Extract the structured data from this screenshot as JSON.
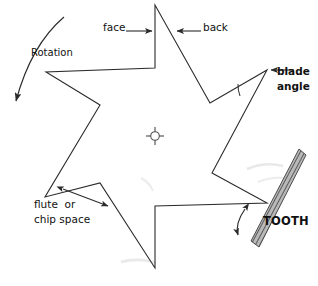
{
  "figure": {
    "kind": "technical-line-diagram",
    "width": 318,
    "height": 286,
    "background_color": "#ffffff",
    "line_color": "#2b2b2b",
    "text_color": "#111111",
    "tooth_fill_color": "#6b6b6b"
  },
  "labels": {
    "face": "face",
    "back": "back",
    "rotation": "Rotation",
    "blade_angle_line1": "blade",
    "blade_angle_line2": "angle",
    "flute_line1": "flute  or",
    "flute_line2": "chip space",
    "tooth": "TOOTH"
  },
  "geometry": {
    "blade_outline_points": "155,5 155,68 46,72 100,105 45,197 100,183 155,268 155,206 267,203 212,173 267,70 210,103",
    "center_mark": {
      "cx": 155,
      "cy": 136,
      "r": 4.5,
      "tick_len": 4
    },
    "rotation_arc": {
      "from": "64,17",
      "to": "13,106",
      "arrow_at": "13,106"
    },
    "face_arrow": {
      "from": "127,31",
      "to": "153,31"
    },
    "back_arrow": {
      "from": "200,31",
      "to": "176,31"
    },
    "blade_angle_arrow": {
      "from": "293,70",
      "to": "270,70"
    },
    "blade_angle_vertex": "267,70",
    "blade_angle_arc_radius": 30,
    "flute_arrow": {
      "from": "62,190",
      "to": "107,205"
    },
    "tooth_bar": {
      "tip": "300,152",
      "heel": "255,243",
      "width": 11
    },
    "tooth_angle_arrow": {
      "vertex": "267,203",
      "arc_radius": 36
    },
    "reference_line": {
      "from": "155,206",
      "to": "267,203"
    }
  }
}
